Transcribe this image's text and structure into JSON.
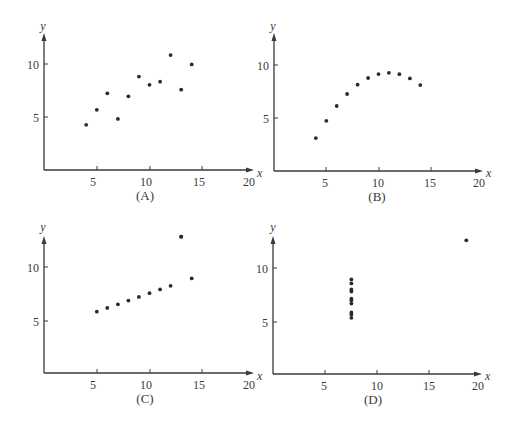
{
  "chart_data": [
    {
      "type": "scatter",
      "title": "(A)",
      "xlabel": "x",
      "ylabel": "y",
      "xlim": [
        0,
        20
      ],
      "ylim": [
        0,
        12.5
      ],
      "xticks": [
        5,
        10,
        15,
        20
      ],
      "yticks": [
        5,
        10
      ],
      "grid": false,
      "x": [
        4,
        5,
        6,
        7,
        8,
        9,
        10,
        11,
        12,
        13,
        14
      ],
      "y": [
        4.26,
        5.68,
        7.24,
        4.82,
        6.95,
        8.81,
        8.04,
        8.33,
        10.84,
        7.58,
        9.96
      ]
    },
    {
      "type": "scatter",
      "title": "(B)",
      "xlabel": "x",
      "ylabel": "y",
      "xlim": [
        0,
        20
      ],
      "ylim": [
        0,
        12.5
      ],
      "xticks": [
        5,
        10,
        15,
        20
      ],
      "yticks": [
        5,
        10
      ],
      "grid": false,
      "x": [
        4,
        5,
        6,
        7,
        8,
        9,
        10,
        11,
        12,
        13,
        14
      ],
      "y": [
        3.1,
        4.74,
        6.13,
        7.26,
        8.14,
        8.77,
        9.14,
        9.26,
        9.13,
        8.74,
        8.1
      ]
    },
    {
      "type": "scatter",
      "title": "(C)",
      "xlabel": "x",
      "ylabel": "y",
      "xlim": [
        0,
        20
      ],
      "ylim": [
        0,
        12.5
      ],
      "xticks": [
        5,
        10,
        15,
        20
      ],
      "yticks": [
        5,
        10
      ],
      "grid": false,
      "x": [
        5,
        6,
        7,
        8,
        9,
        10,
        11,
        12,
        13,
        14,
        13
      ],
      "y": [
        5.73,
        6.08,
        6.42,
        6.77,
        7.11,
        7.46,
        7.81,
        8.15,
        12.74,
        8.84,
        12.74
      ]
    },
    {
      "type": "scatter",
      "title": "(D)",
      "xlabel": "x",
      "ylabel": "y",
      "xlim": [
        0,
        20
      ],
      "ylim": [
        0,
        12.5
      ],
      "xticks": [
        5,
        10,
        15,
        20
      ],
      "yticks": [
        5,
        10
      ],
      "grid": false,
      "x": [
        8,
        8,
        8,
        8,
        8,
        8,
        8,
        8,
        8,
        8,
        19
      ],
      "y": [
        6.58,
        5.76,
        7.71,
        8.84,
        8.47,
        7.04,
        5.25,
        5.56,
        7.91,
        6.89,
        12.5
      ]
    }
  ],
  "panels": [
    {
      "label": "(A)",
      "x_axis_label": "x",
      "y_axis_label": "y",
      "xtick_labels": [
        "5",
        "10",
        "15",
        "20"
      ],
      "ytick_labels": [
        "5",
        "10"
      ]
    },
    {
      "label": "(B)",
      "x_axis_label": "x",
      "y_axis_label": "y",
      "xtick_labels": [
        "5",
        "10",
        "15",
        "20"
      ],
      "ytick_labels": [
        "5",
        "10"
      ]
    },
    {
      "label": "(C)",
      "x_axis_label": "x",
      "y_axis_label": "y",
      "xtick_labels": [
        "5",
        "10",
        "15",
        "20"
      ],
      "ytick_labels": [
        "5",
        "10"
      ]
    },
    {
      "label": "(D)",
      "x_axis_label": "x",
      "y_axis_label": "y",
      "xtick_labels": [
        "5",
        "10",
        "15",
        "20"
      ],
      "ytick_labels": [
        "5",
        "10"
      ]
    }
  ],
  "colors": {
    "axis": "#3a3a3a",
    "point": "#2a2a2a"
  }
}
